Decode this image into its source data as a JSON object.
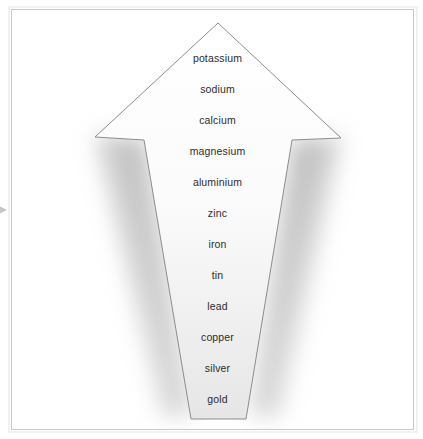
{
  "figure": {
    "type": "arrow-list",
    "direction": "up",
    "arrow_tip_label": "potassium",
    "arrow_base_label": "gold"
  },
  "frame": {
    "border_color": "#c9c9c9",
    "outer_band_color": "#f1f1f1",
    "background": "#ffffff"
  },
  "edge_marker": {
    "icon": "triangle-right-icon",
    "color": "#c6c6c6"
  },
  "arrow": {
    "outline_color": "#8c8c8c",
    "fill_top": "#ffffff",
    "fill_bottom": "#e9e9e9",
    "shadow_color": "#9a9a9a"
  },
  "items": [
    {
      "label": "potassium",
      "rank": 1,
      "y": 58
    },
    {
      "label": "sodium",
      "rank": 2,
      "y": 89
    },
    {
      "label": "calcium",
      "rank": 3,
      "y": 120
    },
    {
      "label": "magnesium",
      "rank": 4,
      "y": 151
    },
    {
      "label": "aluminium",
      "rank": 5,
      "y": 182
    },
    {
      "label": "zinc",
      "rank": 6,
      "y": 213
    },
    {
      "label": "iron",
      "rank": 7,
      "y": 244
    },
    {
      "label": "tin",
      "rank": 8,
      "y": 275
    },
    {
      "label": "lead",
      "rank": 9,
      "y": 306
    },
    {
      "label": "copper",
      "rank": 10,
      "y": 337
    },
    {
      "label": "silver",
      "rank": 11,
      "y": 368
    },
    {
      "label": "gold",
      "rank": 12,
      "y": 399
    }
  ]
}
